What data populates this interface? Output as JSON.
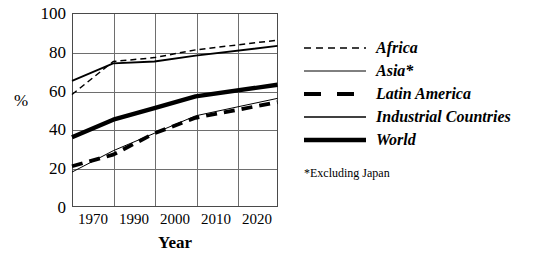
{
  "chart_data": {
    "type": "line",
    "title": "",
    "xlabel": "Year",
    "ylabel": "%",
    "x": [
      1970,
      1990,
      2000,
      2010,
      2020
    ],
    "xtick_labels": [
      "1970",
      "1990",
      "2000",
      "2010",
      "2020"
    ],
    "ytick_labels": [
      "0",
      "20",
      "40",
      "60",
      "80",
      "100"
    ],
    "ytick_values": [
      0,
      20,
      40,
      60,
      80,
      100
    ],
    "ylim": [
      0,
      100
    ],
    "grid": true,
    "legend_position": "right",
    "series": [
      {
        "name": "Africa",
        "style": "dashed-thin",
        "values": [
          58,
          75,
          77,
          81,
          86
        ]
      },
      {
        "name": "Asia*",
        "style": "solid-thin",
        "values": [
          18,
          29,
          38,
          47,
          56
        ]
      },
      {
        "name": "Latin America",
        "style": "dashed-thick",
        "values": [
          21,
          27,
          38,
          46,
          54
        ]
      },
      {
        "name": "Industrial Countries",
        "style": "solid-medium",
        "values": [
          65,
          74,
          75,
          78,
          83
        ]
      },
      {
        "name": "World",
        "style": "solid-extrathick",
        "values": [
          36,
          45,
          51,
          57,
          63
        ]
      }
    ],
    "annotations": [
      "*Excluding Japan"
    ]
  },
  "axes": {
    "y_label": "%",
    "x_label": "Year",
    "y_ticks": [
      "100",
      "80",
      "60",
      "40",
      "20",
      "0"
    ],
    "x_ticks": [
      "1970",
      "1990",
      "2000",
      "2010",
      "2020"
    ]
  },
  "legend": {
    "items": [
      {
        "label": "Africa"
      },
      {
        "label": "Asia*"
      },
      {
        "label": "Latin America"
      },
      {
        "label": "Industrial Countries"
      },
      {
        "label": "World"
      }
    ]
  },
  "footnote": "*Excluding Japan",
  "colors": {
    "line": "#000000",
    "grid": "#6e6e6e",
    "frame": "#4a4a4a",
    "background": "#ffffff"
  }
}
